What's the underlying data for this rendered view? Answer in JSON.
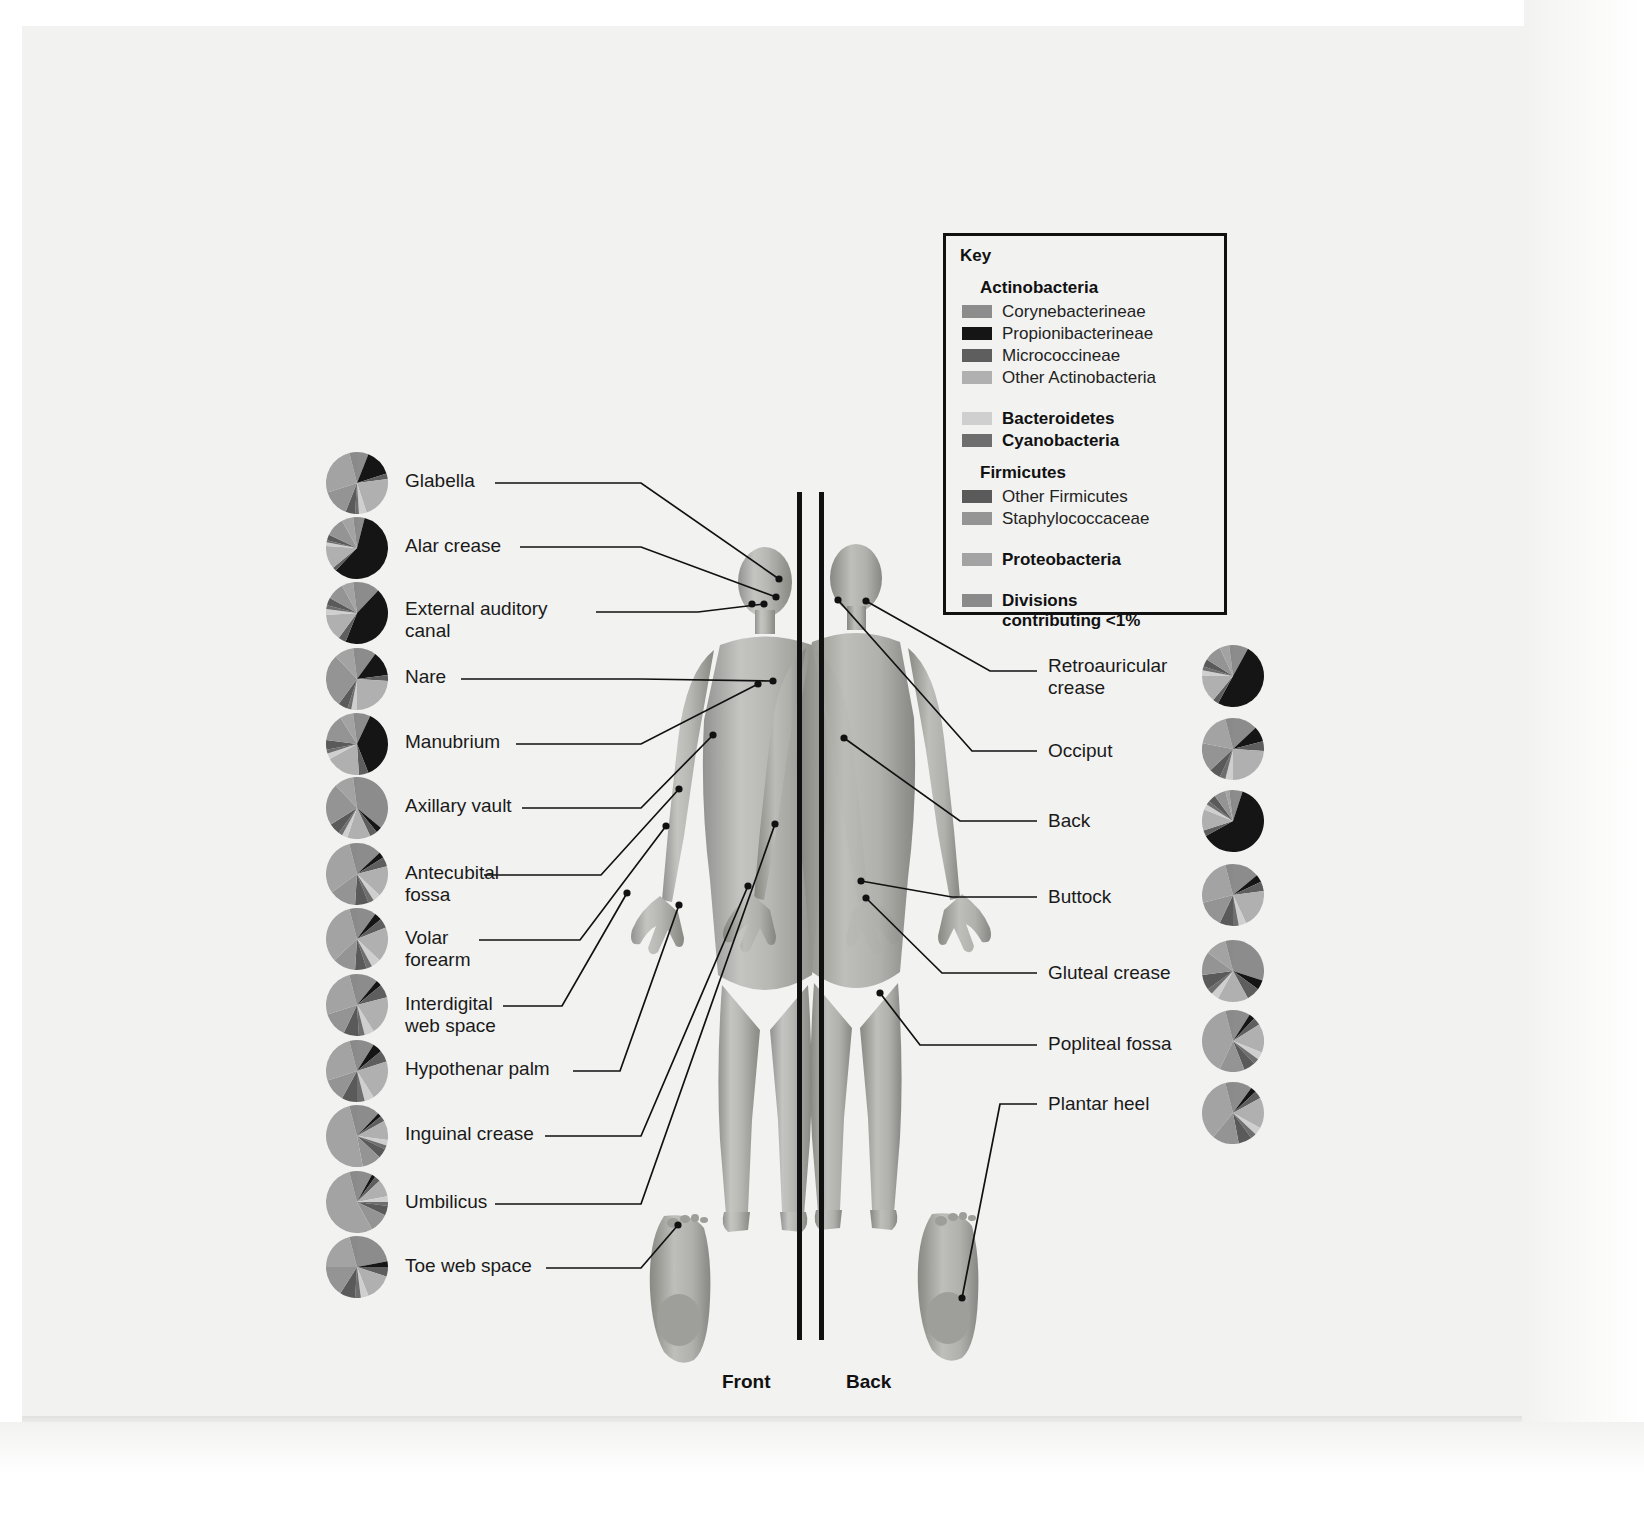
{
  "figure": {
    "front_label": "Front",
    "back_label": "Back"
  },
  "key": {
    "title": "Key",
    "groups": [
      {
        "heading": "Actinobacteria",
        "heading_bold": true,
        "items": [
          {
            "label": "Corynebacterineae",
            "color": "#8c8c8c",
            "bold": false
          },
          {
            "label": "Propionibacterineae",
            "color": "#151515",
            "bold": false
          },
          {
            "label": "Micrococcineae",
            "color": "#5e5e5e",
            "bold": false
          },
          {
            "label": "Other Actinobacteria",
            "color": "#b0b0b0",
            "bold": false
          }
        ]
      },
      {
        "heading": null,
        "items": [
          {
            "label": "Bacteroidetes",
            "color": "#cfcfcf",
            "bold": true
          },
          {
            "label": "Cyanobacteria",
            "color": "#6e6e6e",
            "bold": true
          }
        ]
      },
      {
        "heading": "Firmicutes",
        "heading_bold": true,
        "items": [
          {
            "label": "Other Firmicutes",
            "color": "#5a5a5a",
            "bold": false
          },
          {
            "label": "Staphylococcaceae",
            "color": "#949494",
            "bold": false
          }
        ]
      },
      {
        "heading": null,
        "items": [
          {
            "label": "Proteobacteria",
            "color": "#a3a3a3",
            "bold": true
          }
        ]
      },
      {
        "heading": null,
        "items": [
          {
            "label": "Divisions\ncontributing <1%",
            "color": "#8a8a8a",
            "bold": true
          }
        ]
      }
    ]
  },
  "chart_data": {
    "type": "pie",
    "legend_position": "top-right",
    "taxa": [
      "Corynebacterineae",
      "Propionibacterineae",
      "Micrococcineae",
      "Other Actinobacteria",
      "Bacteroidetes",
      "Cyanobacteria",
      "Other Firmicutes",
      "Staphylococcaceae",
      "Proteobacteria",
      "Divisions contributing <1%"
    ],
    "taxa_colors": [
      "#8c8c8c",
      "#151515",
      "#5e5e5e",
      "#b0b0b0",
      "#cfcfcf",
      "#6e6e6e",
      "#5a5a5a",
      "#949494",
      "#a3a3a3",
      "#8a8a8a"
    ],
    "sites": [
      {
        "name": "Glabella",
        "side": "front",
        "values": [
          6,
          14,
          3,
          22,
          4,
          2,
          5,
          14,
          26,
          4
        ]
      },
      {
        "name": "Alar crease",
        "side": "front",
        "values": [
          4,
          58,
          2,
          12,
          2,
          1,
          3,
          10,
          6,
          2
        ]
      },
      {
        "name": "External auditory canal",
        "side": "front",
        "values": [
          12,
          44,
          4,
          14,
          3,
          2,
          4,
          9,
          6,
          2
        ]
      },
      {
        "name": "Nare",
        "side": "front",
        "values": [
          10,
          13,
          3,
          24,
          3,
          2,
          5,
          28,
          10,
          2
        ]
      },
      {
        "name": "Manubrium",
        "side": "front",
        "values": [
          7,
          37,
          5,
          18,
          3,
          2,
          5,
          14,
          7,
          2
        ]
      },
      {
        "name": "Axillary vault",
        "side": "front",
        "values": [
          36,
          3,
          4,
          12,
          3,
          2,
          6,
          22,
          10,
          2
        ]
      },
      {
        "name": "Antecubital fossa",
        "side": "front",
        "values": [
          13,
          3,
          5,
          16,
          4,
          3,
          7,
          14,
          31,
          4
        ]
      },
      {
        "name": "Volar forearm",
        "side": "front",
        "values": [
          10,
          4,
          5,
          18,
          5,
          3,
          6,
          12,
          33,
          4
        ]
      },
      {
        "name": "Interdigital web space",
        "side": "front",
        "values": [
          11,
          3,
          7,
          20,
          5,
          3,
          8,
          13,
          26,
          4
        ]
      },
      {
        "name": "Hypothenar palm",
        "side": "front",
        "values": [
          9,
          5,
          6,
          21,
          5,
          4,
          8,
          12,
          26,
          4
        ]
      },
      {
        "name": "Inguinal crease",
        "side": "front",
        "values": [
          12,
          2,
          3,
          10,
          3,
          2,
          5,
          10,
          49,
          4
        ]
      },
      {
        "name": "Umbilicus",
        "side": "front",
        "values": [
          8,
          2,
          3,
          9,
          3,
          2,
          5,
          10,
          54,
          4
        ]
      },
      {
        "name": "Toe web space",
        "side": "front",
        "values": [
          22,
          3,
          5,
          14,
          4,
          3,
          8,
          16,
          21,
          4
        ]
      },
      {
        "name": "Retroauricular crease",
        "side": "back",
        "values": [
          8,
          50,
          3,
          14,
          3,
          2,
          4,
          9,
          5,
          2
        ]
      },
      {
        "name": "Occiput",
        "side": "back",
        "values": [
          13,
          8,
          5,
          24,
          4,
          3,
          6,
          15,
          18,
          4
        ]
      },
      {
        "name": "Back",
        "side": "back",
        "values": [
          5,
          62,
          3,
          11,
          3,
          2,
          4,
          6,
          2,
          2
        ]
      },
      {
        "name": "Buttock",
        "side": "back",
        "values": [
          14,
          4,
          5,
          20,
          4,
          3,
          7,
          14,
          25,
          4
        ]
      },
      {
        "name": "Gluteal crease",
        "side": "back",
        "values": [
          30,
          5,
          7,
          16,
          4,
          3,
          8,
          12,
          11,
          4
        ]
      },
      {
        "name": "Popliteal fossa",
        "side": "back",
        "values": [
          9,
          3,
          4,
          15,
          4,
          3,
          6,
          13,
          39,
          4
        ]
      },
      {
        "name": "Plantar heel",
        "side": "back",
        "values": [
          10,
          3,
          4,
          16,
          4,
          3,
          7,
          14,
          35,
          4
        ]
      }
    ]
  },
  "left_labels": [
    "Glabella",
    "Alar crease",
    "External auditory\ncanal",
    "Nare",
    "Manubrium",
    "Axillary vault",
    "Antecubital\nfossa",
    "Volar\nforearm",
    "Interdigital\nweb space",
    "Hypothenar palm",
    "Inguinal crease",
    "Umbilicus",
    "Toe web space"
  ],
  "right_labels": [
    "Retroauricular\ncrease",
    "Occiput",
    "Back",
    "Buttock",
    "Gluteal crease",
    "Popliteal fossa",
    "Plantar heel"
  ]
}
